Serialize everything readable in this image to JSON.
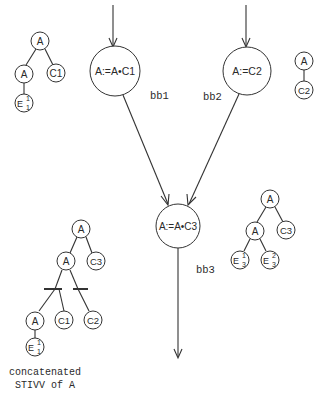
{
  "blocks": [
    {
      "id": "bb1",
      "label": "bb1",
      "statement": "A:=A•C1"
    },
    {
      "id": "bb2",
      "label": "bb2",
      "statement": "A:=C2"
    },
    {
      "id": "bb3",
      "label": "bb3",
      "statement": "A:=A•C3"
    }
  ],
  "trees": {
    "bb1_tree": {
      "root": "A",
      "left": "A",
      "right": "C1",
      "leaf": {
        "base": "E",
        "sup": "1",
        "sub": "1"
      }
    },
    "bb2_tree": {
      "root": "A",
      "child": "C2"
    },
    "bb3_tree": {
      "root": "A",
      "left": "A",
      "right": "C3",
      "leaf1": {
        "base": "E",
        "sup": "1",
        "sub": "3"
      },
      "leaf2": {
        "base": "E",
        "sup": "2",
        "sub": "3"
      }
    },
    "concat_tree": {
      "root": "A",
      "left": "A",
      "right": "C3",
      "alt_children": [
        "A",
        "C1",
        "C2"
      ],
      "leaf": {
        "base": "E",
        "sup": "1",
        "sub": "1"
      }
    }
  },
  "caption": {
    "line1": "concatenated",
    "line2": "STIVV of A"
  }
}
